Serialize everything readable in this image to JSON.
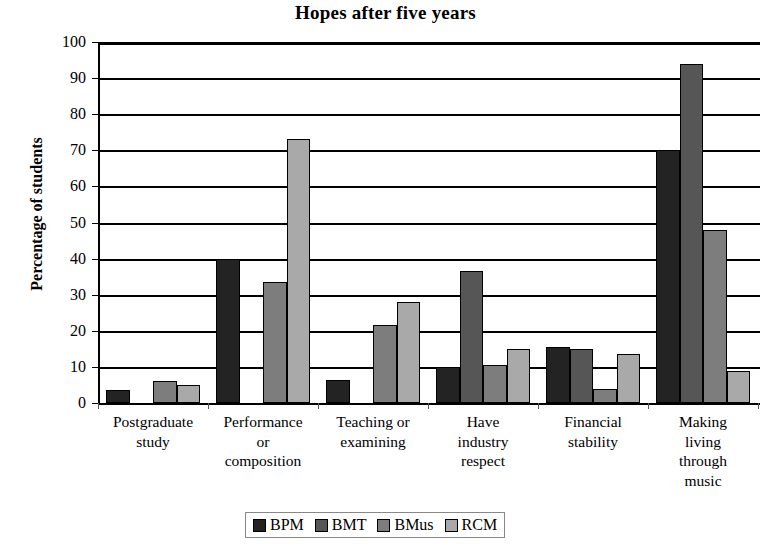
{
  "chart_data": {
    "type": "bar",
    "title": "Hopes after five years",
    "xlabel": "",
    "ylabel": "Percentage of students",
    "ylim": [
      0,
      100
    ],
    "ytick_step": 10,
    "yticks": [
      "100",
      "90",
      "80",
      "70",
      "60",
      "50",
      "40",
      "30",
      "20",
      "10",
      "0"
    ],
    "grid": "horizontal",
    "legend_position": "bottom",
    "categories": [
      "Postgraduate study",
      "Performance or composition",
      "Teaching or examining",
      "Have industry respect",
      "Financial stability",
      "Making living through music"
    ],
    "category_lines": [
      [
        "Postgraduate",
        "study"
      ],
      [
        "Performance",
        "or",
        "composition"
      ],
      [
        "Teaching or",
        "examining"
      ],
      [
        "Have",
        "industry",
        "respect"
      ],
      [
        "Financial",
        "stability"
      ],
      [
        "Making",
        "living",
        "through",
        "music"
      ]
    ],
    "series": [
      {
        "name": "BPM",
        "color": "#232323",
        "values": [
          3.5,
          40,
          6.5,
          10,
          15.5,
          70
        ]
      },
      {
        "name": "BMT",
        "color": "#565656",
        "values": [
          0,
          0,
          0,
          36.5,
          15,
          94
        ]
      },
      {
        "name": "BMus",
        "color": "#7d7d7d",
        "values": [
          6,
          33.5,
          21.5,
          10.5,
          4,
          48
        ]
      },
      {
        "name": "RCM",
        "color": "#a9a9a9",
        "values": [
          5,
          73,
          28,
          15,
          13.5,
          9
        ]
      }
    ]
  }
}
